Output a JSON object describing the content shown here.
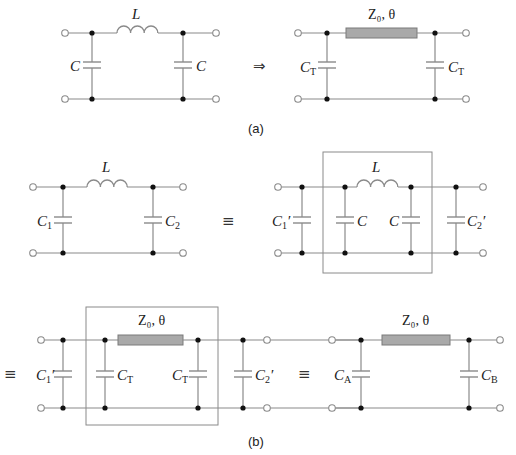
{
  "figure": {
    "part_a": {
      "caption": "(a)",
      "left": {
        "inductor_label": "L",
        "cap_left_label": "C",
        "cap_right_label": "C"
      },
      "arrow_symbol": "⇒",
      "right": {
        "tline_label": "Z₀, θ",
        "cap_left_label": "C",
        "cap_left_sub": "T",
        "cap_right_label": "C",
        "cap_right_sub": "T"
      }
    },
    "part_b": {
      "caption": "(b)",
      "row1_left": {
        "inductor_label": "L",
        "cap_left_label": "C",
        "cap_left_sub": "1",
        "cap_right_label": "C",
        "cap_right_sub": "2"
      },
      "equiv_symbol_1": "≡",
      "row1_right": {
        "inductor_label": "L",
        "outer_left_label": "C",
        "outer_left_sub": "1",
        "outer_left_prime": "′",
        "inner_left_label": "C",
        "inner_right_label": "C",
        "outer_right_label": "C",
        "outer_right_sub": "2",
        "outer_right_prime": "′"
      },
      "equiv_symbol_2": "≡",
      "row2_left": {
        "tline_label": "Z₀, θ",
        "outer_left_label": "C",
        "outer_left_sub": "1",
        "outer_left_prime": "′",
        "inner_left_label": "C",
        "inner_left_sub": "T",
        "inner_right_label": "C",
        "inner_right_sub": "T",
        "outer_right_label": "C",
        "outer_right_sub": "2",
        "outer_right_prime": "′"
      },
      "equiv_symbol_3": "≡",
      "row2_right": {
        "tline_label": "Z₀, θ",
        "cap_left_label": "C",
        "cap_left_sub": "A",
        "cap_right_label": "C",
        "cap_right_sub": "B"
      }
    }
  }
}
